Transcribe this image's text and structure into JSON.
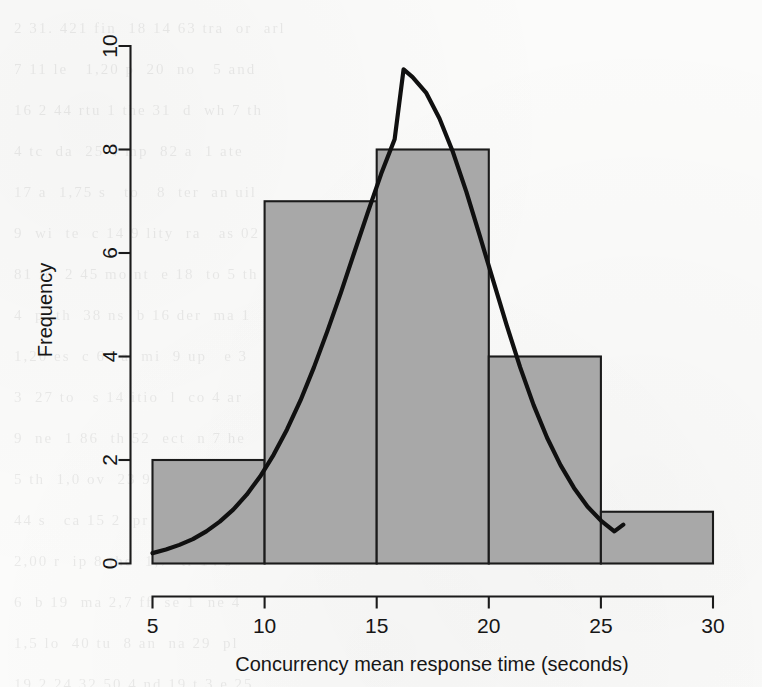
{
  "chart_data": {
    "type": "bar",
    "title": "",
    "subtitle": "",
    "xlabel": "Concurrency mean response time (seconds)",
    "ylabel": "Frequency",
    "xlim": [
      5,
      30
    ],
    "ylim": [
      0,
      10
    ],
    "xticks": [
      5,
      10,
      15,
      20,
      25,
      30
    ],
    "yticks": [
      0,
      2,
      4,
      6,
      8,
      10
    ],
    "xtick_labels": [
      "5",
      "10",
      "15",
      "20",
      "25",
      "30"
    ],
    "ytick_labels": [
      "0",
      "2",
      "4",
      "6",
      "8",
      "10"
    ],
    "grid": false,
    "legend": null,
    "bin_width": 5,
    "bin_edges": [
      5,
      10,
      15,
      20,
      25,
      30
    ],
    "categories": [
      "5-10",
      "10-15",
      "15-20",
      "20-25",
      "25-30"
    ],
    "values": [
      2,
      7,
      8,
      4,
      1
    ],
    "bar_color": "#a8a8a8",
    "bar_edge_color": "#1b1b1b",
    "overlay": {
      "name": "normal density curve",
      "type": "line",
      "color": "#101010",
      "peak_x": 16.2,
      "peak_y": 9.55,
      "x_start": 5.0,
      "x_end": 26.0,
      "y_start": 0.2,
      "y_end": 0.75,
      "points": [
        [
          5.0,
          0.2
        ],
        [
          5.6,
          0.27
        ],
        [
          6.2,
          0.36
        ],
        [
          6.8,
          0.47
        ],
        [
          7.4,
          0.62
        ],
        [
          8.0,
          0.81
        ],
        [
          8.6,
          1.04
        ],
        [
          9.2,
          1.33
        ],
        [
          9.8,
          1.68
        ],
        [
          10.4,
          2.1
        ],
        [
          11.0,
          2.59
        ],
        [
          11.6,
          3.15
        ],
        [
          12.2,
          3.79
        ],
        [
          12.8,
          4.49
        ],
        [
          13.4,
          5.23
        ],
        [
          14.0,
          6.01
        ],
        [
          14.6,
          6.78
        ],
        [
          15.2,
          7.53
        ],
        [
          15.8,
          8.2
        ],
        [
          16.2,
          9.55
        ],
        [
          16.6,
          9.4
        ],
        [
          17.2,
          9.1
        ],
        [
          17.8,
          8.6
        ],
        [
          18.4,
          7.95
        ],
        [
          19.0,
          7.18
        ],
        [
          19.6,
          6.33
        ],
        [
          20.2,
          5.46
        ],
        [
          20.8,
          4.6
        ],
        [
          21.4,
          3.79
        ],
        [
          22.0,
          3.06
        ],
        [
          22.6,
          2.43
        ],
        [
          23.2,
          1.9
        ],
        [
          23.8,
          1.46
        ],
        [
          24.4,
          1.1
        ],
        [
          25.0,
          0.83
        ],
        [
          25.6,
          0.62
        ],
        [
          26.0,
          0.75
        ]
      ]
    }
  },
  "bleed_through_text": "2 31. 421 fin  18 14 63 tra  or  arl\n7 11 le   1,20 p  20  no   5 and\n16 2 44 rtu 1 the 31  d  wh 7 th\n4 tc  da  25 4 mp  82 a  1 ate\n17 a  1,75 s   to   8  ter  an uil\n9  wi  te  c 14 9 lity  ra   as 02\n81 ic  2 45 mo nt  e 18  to 5 th\n4  p  th  38 ns  b 16 der  ma 1\n1,20 es  c 64 a  mi  9 up   e 3\n3  27 to   s 14 itio  l  co 4 ar\n9  ne  1 86  th 52  ect  n 7 he\n5 th  1,0 ov  23 9 al  te  m 1\n44 s   ca 15 2  pr   b 31 an o\n2,00 r  ip 8 the  1,7  tr 14 s\n6  b 19  ma 2,7 ff  se 1  ne 4\n1,5 lo  40 tu  8 an  na 29  pl\n19 2 24 32 50 4 nd 19 t 3 e 25\n5 ma 12 s   1,4  de  ot  28 ar\n3  th 7 ca  9 re  2 na  st 46\n12 10 74 28 30 13 ea 1 d 5 c 2\n15 b 34 5 ac 2,0 in  4 a 19 or\n8  te  2 sy  ul  34 nv  2 8 ti",
  "figure": {
    "kind": "histogram-with-density-overlay",
    "background_color": "#fbfbfa"
  }
}
